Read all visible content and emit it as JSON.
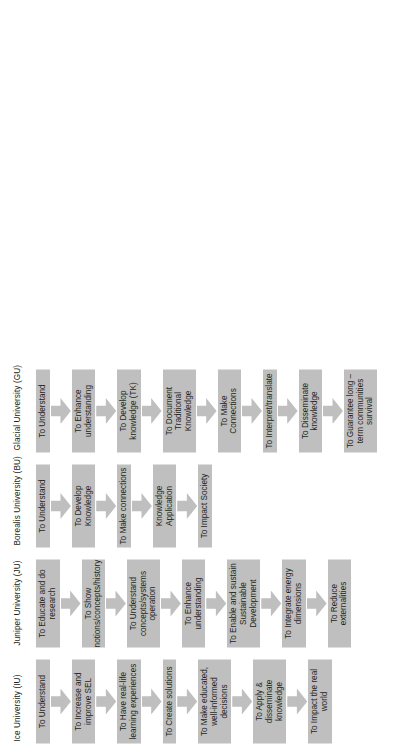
{
  "figure": {
    "type": "process-flow-diagram",
    "orientation": "rotated-90-ccw",
    "box_color": "#bfbfbf",
    "text_color": "#231f20",
    "background": "#ffffff",
    "columns": [
      {
        "id": "iu",
        "header": "Ice University (IU)",
        "steps": [
          "To Understand",
          "To Increase and improve SEL",
          "To Have real-life learning experiences",
          "To Create solutions",
          "To Make educated, well-informed decisions",
          "To Apply & disseminate knowledge",
          "To Impact the real world"
        ]
      },
      {
        "id": "ju",
        "header": "Juniper University (JU)",
        "steps": [
          "To Educate and do research",
          "To Show notions/concepts/history",
          "To Understand concepts/systems operation",
          "To Enhance understanding",
          "To Enable and sustain Sustainable Development",
          "To Integrate energy dimensions",
          "To Reduce externalities"
        ]
      },
      {
        "id": "bu",
        "header": "Borealis University (BU)",
        "steps": [
          "To Understand",
          "To Develop Knowledge",
          "To Make connections",
          "Knowledge Application",
          "To Impact Society"
        ]
      },
      {
        "id": "gu",
        "header": "Glacial University (GU)",
        "steps": [
          "To Understand",
          "To Enhance understanding",
          "To Develop knowledge (TK)",
          "To Document Traditional Knowledge",
          "To Make Connections",
          "To Interpret/translate",
          "To Disseminate knowledge",
          "To Guarantee long – term communities survival"
        ]
      }
    ]
  }
}
